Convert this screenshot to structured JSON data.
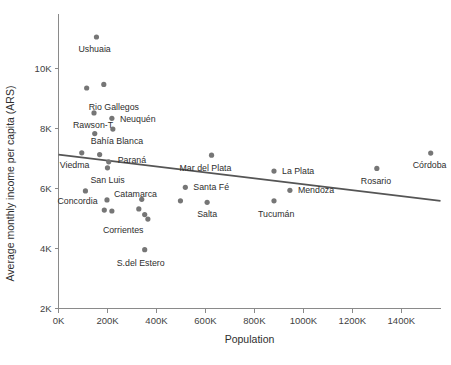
{
  "chart_data": {
    "type": "scatter",
    "title": "",
    "xlabel": "Population",
    "ylabel": "Average monthly income per capita (ARS)",
    "xlim": [
      0,
      1560000
    ],
    "ylim": [
      2000,
      11400
    ],
    "grid": false,
    "legend_position": "none",
    "xtick_labels": [
      "0K",
      "200K",
      "400K",
      "600K",
      "800K",
      "1000K",
      "1200K",
      "1400K"
    ],
    "xtick_values": [
      0,
      200000,
      400000,
      600000,
      800000,
      1000000,
      1200000,
      1400000
    ],
    "ytick_labels": [
      "2K",
      "4K",
      "6K",
      "8K",
      "10K"
    ],
    "ytick_values": [
      2000,
      4000,
      6000,
      8000,
      10000
    ],
    "points": [
      {
        "label": "Ushuaia",
        "x": 155000,
        "y": 11050,
        "label_dx": -18,
        "label_dy": 15
      },
      {
        "label": "Rio Gallegos",
        "x": 115000,
        "y": 9350,
        "label_dx": 2,
        "label_dy": 22
      },
      {
        "label": "",
        "x": 185000,
        "y": 9470,
        "label_dx": 0,
        "label_dy": 0
      },
      {
        "label": "Rawson-T",
        "x": 145000,
        "y": 8520,
        "label_dx": -21,
        "label_dy": 15
      },
      {
        "label": "Neuquén",
        "x": 218000,
        "y": 8340,
        "label_dx": 8,
        "label_dy": 4
      },
      {
        "label": "",
        "x": 148000,
        "y": 7830,
        "label_dx": 0,
        "label_dy": 0
      },
      {
        "label": "Bahía Blanca",
        "x": 222000,
        "y": 7980,
        "label_dx": -22,
        "label_dy": 15
      },
      {
        "label": "Viedma",
        "x": 95000,
        "y": 7190,
        "label_dx": -22,
        "label_dy": 15
      },
      {
        "label": "",
        "x": 168000,
        "y": 7130,
        "label_dx": 0,
        "label_dy": 0
      },
      {
        "label": "Paraná",
        "x": 205000,
        "y": 6890,
        "label_dx": 9,
        "label_dy": 1
      },
      {
        "label": "San Luis",
        "x": 200000,
        "y": 6690,
        "label_dx": -17,
        "label_dy": 15
      },
      {
        "label": "Concordia",
        "x": 110000,
        "y": 5920,
        "label_dx": -28,
        "label_dy": 13
      },
      {
        "label": "Catamarca",
        "x": 198000,
        "y": 5620,
        "label_dx": 7,
        "label_dy": -3
      },
      {
        "label": "",
        "x": 340000,
        "y": 5640,
        "label_dx": 0,
        "label_dy": 0
      },
      {
        "label": "",
        "x": 187000,
        "y": 5280,
        "label_dx": 0,
        "label_dy": 0
      },
      {
        "label": "Corrientes",
        "x": 218000,
        "y": 5250,
        "label_dx": -9,
        "label_dy": 22
      },
      {
        "label": "",
        "x": 328000,
        "y": 5320,
        "label_dx": 0,
        "label_dy": 0
      },
      {
        "label": "",
        "x": 352000,
        "y": 5130,
        "label_dx": 0,
        "label_dy": 0
      },
      {
        "label": "",
        "x": 365000,
        "y": 4980,
        "label_dx": 0,
        "label_dy": 0
      },
      {
        "label": "S.del Estero",
        "x": 352000,
        "y": 3960,
        "label_dx": -28,
        "label_dy": 16
      },
      {
        "label": "Mar del Plata",
        "x": 625000,
        "y": 7110,
        "label_dx": -32,
        "label_dy": 16
      },
      {
        "label": "Santa Fé",
        "x": 518000,
        "y": 6040,
        "label_dx": 8,
        "label_dy": 3
      },
      {
        "label": "Salta",
        "x": 607000,
        "y": 5540,
        "label_dx": -10,
        "label_dy": 15
      },
      {
        "label": "",
        "x": 498000,
        "y": 5590,
        "label_dx": 0,
        "label_dy": 0
      },
      {
        "label": "La Plata",
        "x": 880000,
        "y": 6580,
        "label_dx": 8,
        "label_dy": 3
      },
      {
        "label": "Mendoza",
        "x": 945000,
        "y": 5940,
        "label_dx": 8,
        "label_dy": 3
      },
      {
        "label": "Tucumán",
        "x": 880000,
        "y": 5590,
        "label_dx": -16,
        "label_dy": 16
      },
      {
        "label": "Rosario",
        "x": 1300000,
        "y": 6670,
        "label_dx": -16,
        "label_dy": 16
      },
      {
        "label": "Córdoba",
        "x": 1520000,
        "y": 7180,
        "label_dx": -18,
        "label_dy": 15
      }
    ],
    "trendline": {
      "x_start": 0,
      "y_start": 7130,
      "x_end": 1560000,
      "y_end": 5590
    }
  }
}
